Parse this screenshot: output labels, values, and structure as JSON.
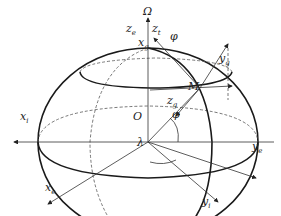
{
  "figure": {
    "type": "earth-ellipsoid-coordinate-frames",
    "labels": {
      "omega": "Ω",
      "ze": "z",
      "ze_sub": "e",
      "zt": "z",
      "zt_sub": "t",
      "xg": "x",
      "xg_sub": "g",
      "phi_top": "φ",
      "yg": "y",
      "yg_sub": "g",
      "M": "M",
      "zg": "z",
      "zg_sub": "g",
      "phi_center": "φ",
      "O": "O",
      "xi": "x",
      "xi_sub": "i",
      "lambda": "λ",
      "ye": "y",
      "ye_sub": "e",
      "yi": "y",
      "yi_sub": "i",
      "xe": "x",
      "xe_sub": "e"
    },
    "colors": {
      "line": "#2a2a2a",
      "background": "#ffffff"
    }
  }
}
